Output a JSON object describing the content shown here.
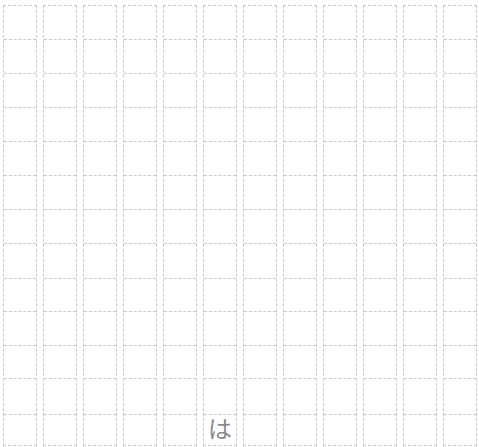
{
  "sheet": {
    "columns": 12,
    "rows": 13,
    "line_color": "#c8c8c8",
    "text_color": "#8a8a8a",
    "filled_cells": [
      {
        "col": 5,
        "row": 12,
        "char": "は"
      }
    ]
  }
}
